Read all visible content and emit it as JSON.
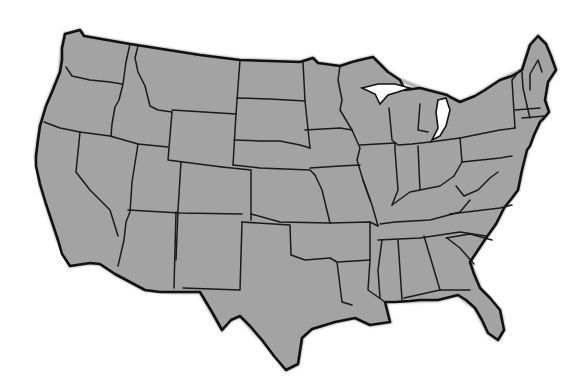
{
  "map": {
    "title": "",
    "subject": "Contiguous United States outline map with state borders",
    "labels": [],
    "colors": {
      "land": "#a3a3a3",
      "border": "#1a1a1a",
      "background": "#ffffff",
      "water": "#ffffff"
    },
    "legend": [],
    "states_shown": 48
  }
}
